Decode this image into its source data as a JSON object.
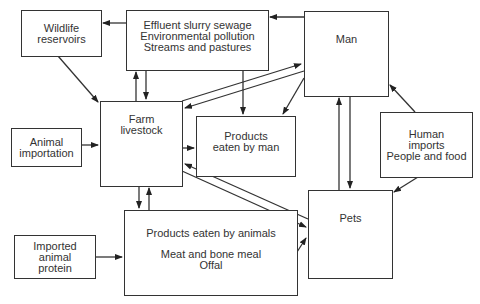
{
  "diagram": {
    "type": "flow",
    "nodes": {
      "wildlife": {
        "lines": [
          "Wildlife",
          "reservoirs"
        ]
      },
      "effluent": {
        "lines": [
          "Effluent slurry sewage",
          "Environmental pollution",
          "Streams and pastures"
        ]
      },
      "man": {
        "lines": [
          "Man"
        ]
      },
      "farm": {
        "lines": [
          "Farm",
          "livestock"
        ]
      },
      "products_man": {
        "lines": [
          "Products",
          "eaten by man"
        ]
      },
      "animal_import": {
        "lines": [
          "Animal",
          "importation"
        ]
      },
      "human_imports": {
        "lines": [
          "Human",
          "imports",
          "People and food"
        ]
      },
      "pets": {
        "lines": [
          "Pets"
        ]
      },
      "products_animals": {
        "lines": [
          "Products eaten by animals",
          "Meat and bone meal",
          "Offal"
        ]
      },
      "imported_protein": {
        "lines": [
          "Imported",
          "animal",
          "protein"
        ]
      }
    },
    "edges": [
      {
        "from": "Effluent slurry sewage",
        "to": "Wildlife reservoirs"
      },
      {
        "from": "Man",
        "to": "Effluent slurry sewage"
      },
      {
        "from": "Wildlife reservoirs",
        "to": "Farm livestock"
      },
      {
        "from": "Farm livestock",
        "to": "Effluent slurry sewage"
      },
      {
        "from": "Effluent slurry sewage",
        "to": "Farm livestock"
      },
      {
        "from": "Effluent slurry sewage",
        "to": "Products eaten by man"
      },
      {
        "from": "Farm livestock",
        "to": "Man"
      },
      {
        "from": "Man",
        "to": "Farm livestock"
      },
      {
        "from": "Man",
        "to": "Products eaten by man"
      },
      {
        "from": "Animal importation",
        "to": "Farm livestock"
      },
      {
        "from": "Farm livestock",
        "to": "Products eaten by man"
      },
      {
        "from": "Human imports",
        "to": "Man"
      },
      {
        "from": "Human imports",
        "to": "Pets"
      },
      {
        "from": "Pets",
        "to": "Man"
      },
      {
        "from": "Man",
        "to": "Pets"
      },
      {
        "from": "Farm livestock",
        "to": "Pets"
      },
      {
        "from": "Pets",
        "to": "Farm livestock"
      },
      {
        "from": "Farm livestock",
        "to": "Products eaten by animals"
      },
      {
        "from": "Products eaten by animals",
        "to": "Farm livestock"
      },
      {
        "from": "Products eaten by animals",
        "to": "Pets"
      },
      {
        "from": "Imported animal protein",
        "to": "Products eaten by animals"
      }
    ],
    "colors": {
      "line": "#333333",
      "text": "#333333",
      "background": "#ffffff"
    }
  }
}
